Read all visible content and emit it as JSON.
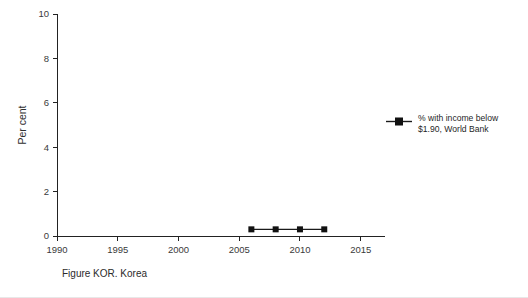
{
  "caption": "Figure KOR. Korea",
  "legend": {
    "marker_icon": "square-line-marker",
    "label": "% with income below\n$1.90, World Bank"
  },
  "chart_data": {
    "type": "line",
    "title": "",
    "xlabel": "",
    "ylabel": "Per cent",
    "xlim": [
      1990,
      2017
    ],
    "ylim": [
      0,
      10
    ],
    "xticks": [
      1990,
      1995,
      2000,
      2005,
      2010,
      2015
    ],
    "xtick_labels": [
      "1990",
      "1995",
      "2000",
      "2005",
      "2010",
      "2015"
    ],
    "yticks": [
      0,
      2,
      4,
      6,
      8,
      10
    ],
    "ytick_labels": [
      "0",
      "2",
      "4",
      "6",
      "8",
      "10"
    ],
    "grid": false,
    "legend_position": "right",
    "series": [
      {
        "name": "% with income below $1.90, World Bank",
        "marker": "square",
        "color": "#111111",
        "x": [
          2006,
          2008,
          2010,
          2012
        ],
        "values": [
          0.3,
          0.3,
          0.3,
          0.3
        ]
      }
    ]
  }
}
